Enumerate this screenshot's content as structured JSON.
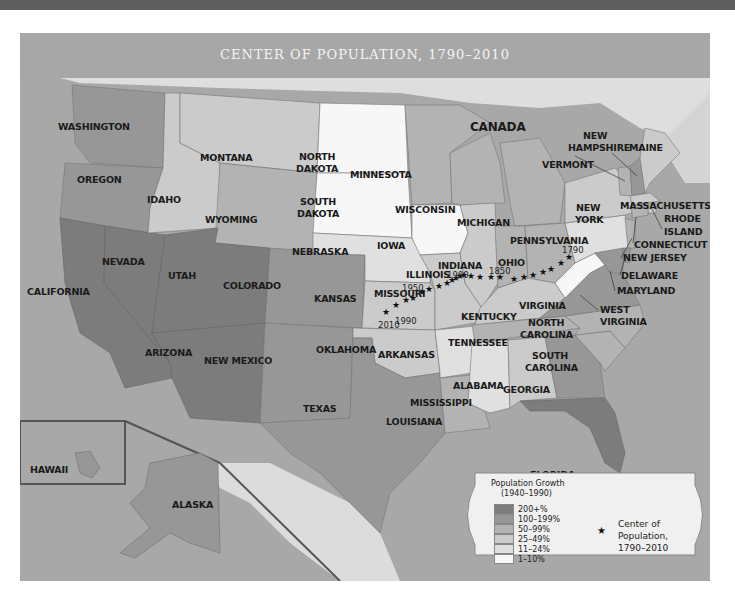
{
  "map": {
    "title": "CENTER OF POPULATION, 1790–2010",
    "country_label": "CANADA",
    "states": [
      {
        "name": "WASHINGTON",
        "class": "100-199%"
      },
      {
        "name": "OREGON",
        "class": "100-199%"
      },
      {
        "name": "CALIFORNIA",
        "class": "200+%"
      },
      {
        "name": "NEVADA",
        "class": "200+%"
      },
      {
        "name": "IDAHO",
        "class": "25-49%"
      },
      {
        "name": "MONTANA",
        "class": "25-49%"
      },
      {
        "name": "WYOMING",
        "class": "50-99%"
      },
      {
        "name": "UTAH",
        "class": "200+%"
      },
      {
        "name": "ARIZONA",
        "class": "200+%"
      },
      {
        "name": "COLORADO",
        "class": "100-199%"
      },
      {
        "name": "NEW MEXICO",
        "class": "100-199%"
      },
      {
        "name": "NORTH DAKOTA",
        "class": "1-10%"
      },
      {
        "name": "SOUTH DAKOTA",
        "class": "1-10%"
      },
      {
        "name": "NEBRASKA",
        "class": "11-24%"
      },
      {
        "name": "KANSAS",
        "class": "25-49%"
      },
      {
        "name": "OKLAHOMA",
        "class": "25-49%"
      },
      {
        "name": "TEXAS",
        "class": "100-199%"
      },
      {
        "name": "MINNESOTA",
        "class": "50-99%"
      },
      {
        "name": "IOWA",
        "class": "1-10%"
      },
      {
        "name": "MISSOURI",
        "class": "25-49%"
      },
      {
        "name": "ARKANSAS",
        "class": "11-24%"
      },
      {
        "name": "LOUISIANA",
        "class": "50-99%"
      },
      {
        "name": "WISCONSIN",
        "class": "50-99%"
      },
      {
        "name": "ILLINOIS",
        "class": "25-49%"
      },
      {
        "name": "MICHIGAN",
        "class": "50-99%"
      },
      {
        "name": "INDIANA",
        "class": "50-99%"
      },
      {
        "name": "OHIO",
        "class": "50-99%"
      },
      {
        "name": "KENTUCKY",
        "class": "25-49%"
      },
      {
        "name": "TENNESSEE",
        "class": "50-99%"
      },
      {
        "name": "MISSISSIPPI",
        "class": "11-24%"
      },
      {
        "name": "ALABAMA",
        "class": "25-49%"
      },
      {
        "name": "GEORGIA",
        "class": "100-199%"
      },
      {
        "name": "FLORIDA",
        "class": "200+%"
      },
      {
        "name": "SOUTH CAROLINA",
        "class": "50-99%"
      },
      {
        "name": "NORTH CAROLINA",
        "class": "50-99%"
      },
      {
        "name": "VIRGINIA",
        "class": "100-199%"
      },
      {
        "name": "WEST VIRGINIA",
        "class": "1-10%"
      },
      {
        "name": "PENNSYLVANIA",
        "class": "11-24%"
      },
      {
        "name": "NEW YORK",
        "class": "25-49%"
      },
      {
        "name": "VERMONT",
        "class": "50-99%"
      },
      {
        "name": "NEW HAMPSHIRE",
        "class": "100-199%"
      },
      {
        "name": "MAINE",
        "class": "25-49%"
      },
      {
        "name": "MASSACHUSETTS",
        "class": "25-49%"
      },
      {
        "name": "RHODE ISLAND",
        "class": "25-49%"
      },
      {
        "name": "CONNECTICUT",
        "class": "50-99%"
      },
      {
        "name": "NEW JERSEY",
        "class": "50-99%"
      },
      {
        "name": "DELAWARE",
        "class": "100-199%"
      },
      {
        "name": "MARYLAND",
        "class": "100-199%"
      },
      {
        "name": "HAWAII",
        "class": "100-199%"
      },
      {
        "name": "ALASKA",
        "class": "100-199%"
      }
    ],
    "labels": {
      "washington": "WASHINGTON",
      "oregon": "OREGON",
      "california": "CALIFORNIA",
      "nevada": "NEVADA",
      "idaho": "IDAHO",
      "montana": "MONTANA",
      "wyoming": "WYOMING",
      "utah": "UTAH",
      "arizona": "ARIZONA",
      "colorado": "COLORADO",
      "new_mexico": "NEW MEXICO",
      "north_dakota_1": "NORTH",
      "north_dakota_2": "DAKOTA",
      "south_dakota_1": "SOUTH",
      "south_dakota_2": "DAKOTA",
      "nebraska": "NEBRASKA",
      "kansas": "KANSAS",
      "oklahoma": "OKLAHOMA",
      "texas": "TEXAS",
      "minnesota": "MINNESOTA",
      "iowa": "IOWA",
      "missouri": "MISSOURI",
      "arkansas": "ARKANSAS",
      "louisiana": "LOUISIANA",
      "wisconsin": "WISCONSIN",
      "illinois": "ILLINOIS",
      "michigan": "MICHIGAN",
      "indiana": "INDIANA",
      "ohio": "OHIO",
      "kentucky": "KENTUCKY",
      "tennessee": "TENNESSEE",
      "mississippi": "MISSISSIPPI",
      "alabama": "ALABAMA",
      "georgia": "GEORGIA",
      "florida": "FLORIDA",
      "south_carolina_1": "SOUTH",
      "south_carolina_2": "CAROLINA",
      "north_carolina_1": "NORTH",
      "north_carolina_2": "CAROLINA",
      "virginia": "VIRGINIA",
      "west_virginia_1": "WEST",
      "west_virginia_2": "VIRGINIA",
      "pennsylvania": "PENNSYLVANIA",
      "new_york_1": "NEW",
      "new_york_2": "YORK",
      "vermont": "VERMONT",
      "new_hampshire_1": "NEW",
      "new_hampshire_2": "HAMPSHIRE",
      "maine": "MAINE",
      "massachusetts": "MASSACHUSETTS",
      "rhode_island_1": "RHODE",
      "rhode_island_2": "ISLAND",
      "connecticut": "CONNECTICUT",
      "new_jersey": "NEW JERSEY",
      "delaware": "DELAWARE",
      "maryland": "MARYLAND",
      "hawaii": "HAWAII",
      "alaska": "ALASKA"
    },
    "center_years": {
      "y1790": "1790",
      "y1850": "1850",
      "y1900": "1900",
      "y1950": "1950",
      "y1990": "1990",
      "y2010": "2010"
    }
  },
  "legend": {
    "title": "Population Growth",
    "subtitle": "(1940–1990)",
    "items": [
      {
        "label": "200+%",
        "color": "#7c7c7c"
      },
      {
        "label": "100–199%",
        "color": "#979797"
      },
      {
        "label": "50–99%",
        "color": "#b3b3b3"
      },
      {
        "label": "25–49%",
        "color": "#cbcbcb"
      },
      {
        "label": "11–24%",
        "color": "#e0e0e0"
      },
      {
        "label": "1–10%",
        "color": "#f7f7f7"
      }
    ],
    "star_symbol": "★",
    "center_label_1": "Center of Population,",
    "center_label_2": "1790–2010"
  },
  "colors": {
    "c200": "#7c7c7c",
    "c100": "#979797",
    "c50": "#b3b3b3",
    "c25": "#cbcbcb",
    "c11": "#e0e0e0",
    "c1": "#f7f7f7",
    "ocean": "#a9a9a9",
    "land_foreign": "#dcdcdc"
  }
}
